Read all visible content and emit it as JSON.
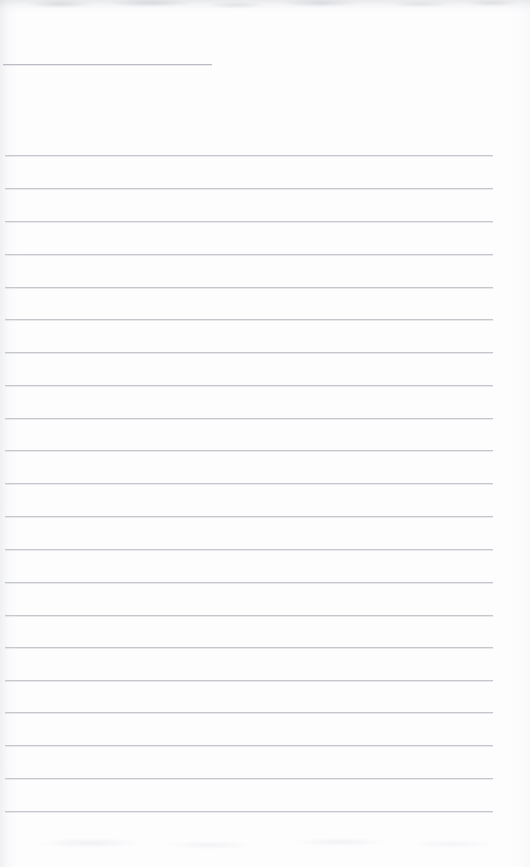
{
  "document": {
    "kind": "scanned-blank-ruled-page",
    "title": "",
    "body_text": "",
    "page_width": 530,
    "page_height": 867,
    "paper_color": "#fdfdfe",
    "rule_color": "#c6c7cd",
    "rule_short_color": "#bcbdc4"
  },
  "header_rule": {
    "name": "header-rule",
    "x": 3,
    "y": 64,
    "width": 209,
    "height": 1
  },
  "ruled_lines": {
    "count": 21,
    "x": 5,
    "width": 488,
    "first_y": 155,
    "spacing": 32.8,
    "items": [
      {
        "index": 1,
        "y": 155,
        "x": 5,
        "width": 488
      },
      {
        "index": 2,
        "y": 188,
        "x": 5,
        "width": 488
      },
      {
        "index": 3,
        "y": 221,
        "x": 5,
        "width": 488
      },
      {
        "index": 4,
        "y": 254,
        "x": 5,
        "width": 488
      },
      {
        "index": 5,
        "y": 287,
        "x": 5,
        "width": 488
      },
      {
        "index": 6,
        "y": 319,
        "x": 5,
        "width": 488
      },
      {
        "index": 7,
        "y": 352,
        "x": 5,
        "width": 488
      },
      {
        "index": 8,
        "y": 385,
        "x": 5,
        "width": 488
      },
      {
        "index": 9,
        "y": 418,
        "x": 5,
        "width": 488
      },
      {
        "index": 10,
        "y": 450,
        "x": 5,
        "width": 488
      },
      {
        "index": 11,
        "y": 483,
        "x": 5,
        "width": 488
      },
      {
        "index": 12,
        "y": 516,
        "x": 5,
        "width": 488
      },
      {
        "index": 13,
        "y": 549,
        "x": 5,
        "width": 488
      },
      {
        "index": 14,
        "y": 582,
        "x": 5,
        "width": 488
      },
      {
        "index": 15,
        "y": 615,
        "x": 5,
        "width": 488
      },
      {
        "index": 16,
        "y": 647,
        "x": 5,
        "width": 488
      },
      {
        "index": 17,
        "y": 680,
        "x": 5,
        "width": 488
      },
      {
        "index": 18,
        "y": 712,
        "x": 5,
        "width": 488
      },
      {
        "index": 19,
        "y": 745,
        "x": 5,
        "width": 488
      },
      {
        "index": 20,
        "y": 778,
        "x": 5,
        "width": 488
      },
      {
        "index": 21,
        "y": 811,
        "x": 5,
        "width": 488
      }
    ]
  },
  "scan_artifacts": {
    "top_band": {
      "name": "scan-band-top",
      "y": 0,
      "height": 14
    },
    "left_edge": {
      "name": "scan-edge-left",
      "x": 0,
      "width": 18
    },
    "right_edge": {
      "name": "scan-edge-right",
      "width": 22
    },
    "bottom_band": {
      "name": "scan-band-bottom",
      "height": 46
    }
  }
}
